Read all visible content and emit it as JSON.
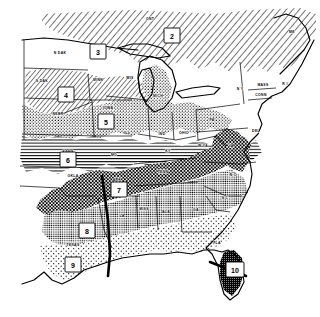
{
  "map": {
    "title": "Plant Hardiness Zone Map",
    "region": "Eastern and Central United States",
    "style": "black-and-white line map with patterned zone fills",
    "zone_markers": [
      {
        "id": "zone-2",
        "label": "2",
        "x": 172,
        "y": 36,
        "pattern": "diagonal-hatch"
      },
      {
        "id": "zone-3",
        "label": "3",
        "x": 98,
        "y": 52,
        "pattern": "white"
      },
      {
        "id": "zone-4",
        "label": "4",
        "x": 66,
        "y": 95,
        "pattern": "diagonal-hatch"
      },
      {
        "id": "zone-5",
        "label": "5",
        "x": 106,
        "y": 122,
        "pattern": "stipple-dots"
      },
      {
        "id": "zone-6",
        "label": "6",
        "x": 68,
        "y": 160,
        "pattern": "horizontal-lines"
      },
      {
        "id": "zone-7",
        "label": "7",
        "x": 119,
        "y": 190,
        "pattern": "dense-crosshatch"
      },
      {
        "id": "zone-8",
        "label": "8",
        "x": 87,
        "y": 231,
        "pattern": "light-gray"
      },
      {
        "id": "zone-9",
        "label": "9",
        "x": 73,
        "y": 265,
        "pattern": "sparse-stipple"
      },
      {
        "id": "zone-10",
        "label": "10",
        "x": 235,
        "y": 270,
        "pattern": "dark-gray"
      }
    ],
    "state_labels": [
      {
        "id": "state-n-dak",
        "text": "N DAK",
        "x": 60,
        "y": 53
      },
      {
        "id": "state-s-dak",
        "text": "S DAK",
        "x": 42,
        "y": 81
      },
      {
        "id": "state-minn",
        "text": "MINN",
        "x": 98,
        "y": 80
      },
      {
        "id": "state-wis",
        "text": "WIS",
        "x": 130,
        "y": 78
      },
      {
        "id": "state-nebr",
        "text": "NEBR",
        "x": 58,
        "y": 114
      },
      {
        "id": "state-iowa",
        "text": "IOWA",
        "x": 108,
        "y": 108
      },
      {
        "id": "state-ill",
        "text": "ILL",
        "x": 127,
        "y": 133
      },
      {
        "id": "state-mich",
        "text": "MICH",
        "x": 158,
        "y": 96
      },
      {
        "id": "state-ind",
        "text": "IND",
        "x": 162,
        "y": 134
      },
      {
        "id": "state-ohio",
        "text": "OHIO",
        "x": 184,
        "y": 133
      },
      {
        "id": "state-kans",
        "text": "KANS",
        "x": 68,
        "y": 152
      },
      {
        "id": "state-mo",
        "text": "MO",
        "x": 114,
        "y": 155
      },
      {
        "id": "state-okla",
        "text": "OKLA",
        "x": 73,
        "y": 176
      },
      {
        "id": "state-ark",
        "text": "ARK",
        "x": 117,
        "y": 180
      },
      {
        "id": "state-ky",
        "text": "KY",
        "x": 168,
        "y": 151
      },
      {
        "id": "state-w-va",
        "text": "W VA",
        "x": 203,
        "y": 146
      },
      {
        "id": "state-va",
        "text": "VA",
        "x": 231,
        "y": 146
      },
      {
        "id": "state-tenn",
        "text": "TENN",
        "x": 163,
        "y": 172
      },
      {
        "id": "state-n-c",
        "text": "N C",
        "x": 233,
        "y": 175
      },
      {
        "id": "state-s-c",
        "text": "S C",
        "x": 225,
        "y": 198
      },
      {
        "id": "state-miss",
        "text": "MISS",
        "x": 144,
        "y": 209
      },
      {
        "id": "state-ala",
        "text": "ALA",
        "x": 166,
        "y": 212
      },
      {
        "id": "state-ga",
        "text": "GA",
        "x": 196,
        "y": 210
      },
      {
        "id": "state-la",
        "text": "LA",
        "x": 122,
        "y": 216
      },
      {
        "id": "state-texas",
        "text": "TEXAS",
        "x": 73,
        "y": 245
      },
      {
        "id": "state-fla",
        "text": "FLA",
        "x": 217,
        "y": 243
      },
      {
        "id": "state-pa",
        "text": "PA",
        "x": 212,
        "y": 120
      },
      {
        "id": "state-n-y",
        "text": "N Y",
        "x": 240,
        "y": 89
      },
      {
        "id": "state-me",
        "text": "ME",
        "x": 292,
        "y": 32
      },
      {
        "id": "state-mass",
        "text": "MASS",
        "x": 263,
        "y": 85
      },
      {
        "id": "state-conn",
        "text": "CONN",
        "x": 261,
        "y": 95
      },
      {
        "id": "state-r-i",
        "text": "R I",
        "x": 285,
        "y": 84
      },
      {
        "id": "state-del",
        "text": "DEL",
        "x": 256,
        "y": 131
      },
      {
        "id": "state-ont",
        "text": "ONT",
        "x": 150,
        "y": 19
      }
    ]
  }
}
